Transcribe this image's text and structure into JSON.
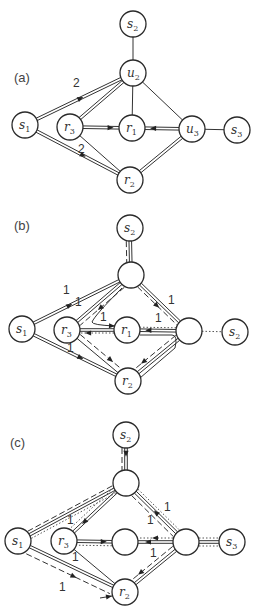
{
  "colors": {
    "stroke": "#2a2a2a",
    "background": "#ffffff",
    "text": "#333333"
  },
  "panels": [
    {
      "id": "a",
      "label": "(a)",
      "label_pos": [
        14,
        82
      ],
      "nodes": [
        {
          "id": "s2",
          "base": "s",
          "sub": "2",
          "x": 133,
          "y": 24
        },
        {
          "id": "u2",
          "base": "u",
          "sub": "2",
          "x": 133,
          "y": 73
        },
        {
          "id": "s1",
          "base": "s",
          "sub": "1",
          "x": 25,
          "y": 125
        },
        {
          "id": "r3",
          "base": "r",
          "sub": "3",
          "x": 70,
          "y": 127
        },
        {
          "id": "r1",
          "base": "r",
          "sub": "1",
          "x": 132,
          "y": 128
        },
        {
          "id": "u3",
          "base": "u",
          "sub": "3",
          "x": 192,
          "y": 129
        },
        {
          "id": "s3",
          "base": "s",
          "sub": "3",
          "x": 237,
          "y": 130
        },
        {
          "id": "r2",
          "base": "r",
          "sub": "2",
          "x": 130,
          "y": 180
        }
      ],
      "edges": [
        {
          "from": "s2",
          "to": "u2",
          "style": "single"
        },
        {
          "from": "u2",
          "to": "r1",
          "style": "single"
        },
        {
          "from": "u2",
          "to": "u3",
          "style": "single"
        },
        {
          "from": "u3",
          "to": "s3",
          "style": "single"
        },
        {
          "from": "r3",
          "to": "r2",
          "style": "single"
        },
        {
          "from": "s1",
          "to": "u2",
          "style": "double",
          "arrow": 0.55
        },
        {
          "from": "r3",
          "to": "u2",
          "style": "double"
        },
        {
          "from": "r3",
          "to": "r1",
          "style": "double",
          "arrow": 0.85
        },
        {
          "from": "u3",
          "to": "r1",
          "style": "double",
          "arrow": 0.85
        },
        {
          "from": "s1",
          "to": "r2",
          "style": "double",
          "arrow": 0.6
        },
        {
          "from": "r2",
          "to": "u3",
          "style": "double"
        }
      ],
      "edge_labels": [
        {
          "text": "2",
          "x": 73,
          "y": 87
        },
        {
          "text": "2",
          "x": 78,
          "y": 153
        }
      ]
    },
    {
      "id": "b",
      "label": "(b)",
      "label_pos": [
        14,
        230
      ],
      "nodes": [
        {
          "id": "s2",
          "base": "s",
          "sub": "2",
          "x": 130,
          "y": 228
        },
        {
          "id": "top",
          "base": "",
          "sub": "",
          "x": 131,
          "y": 275
        },
        {
          "id": "s1",
          "base": "s",
          "sub": "1",
          "x": 22,
          "y": 329
        },
        {
          "id": "r3",
          "base": "r",
          "sub": "3",
          "x": 67,
          "y": 330
        },
        {
          "id": "r1",
          "base": "r",
          "sub": "1",
          "x": 127,
          "y": 330
        },
        {
          "id": "mid",
          "base": "",
          "sub": "",
          "x": 189,
          "y": 331
        },
        {
          "id": "s2r",
          "base": "s",
          "sub": "2",
          "x": 235,
          "y": 332
        },
        {
          "id": "r2",
          "base": "r",
          "sub": "2",
          "x": 128,
          "y": 381
        }
      ],
      "edges": [
        {
          "from": "s2",
          "to": "top",
          "style": "double"
        },
        {
          "from": "s2",
          "to": "top",
          "style": "dash",
          "offset": 4
        },
        {
          "from": "s1",
          "to": "top",
          "style": "double",
          "arrow": 0.45
        },
        {
          "from": "top",
          "to": "r3",
          "style": "double"
        },
        {
          "from": "top",
          "to": "r3",
          "style": "dash",
          "offset": -5,
          "arrow": 0.6
        },
        {
          "from": "top",
          "to": "mid",
          "style": "double"
        },
        {
          "from": "top",
          "to": "mid",
          "style": "dash",
          "offset": 4,
          "arrow": 0.55
        },
        {
          "from": "r3",
          "to": "r1",
          "style": "double"
        },
        {
          "from": "r1",
          "to": "r3",
          "style": "dot",
          "offset": -3,
          "arrow": 0.85
        },
        {
          "from": "mid",
          "to": "r1",
          "style": "double",
          "arrow": 0.85
        },
        {
          "from": "mid",
          "to": "r1",
          "style": "dot",
          "offset": 3
        },
        {
          "from": "mid",
          "to": "s2r",
          "style": "dot"
        },
        {
          "from": "s1",
          "to": "r2",
          "style": "double",
          "arrow": 0.6
        },
        {
          "from": "r3",
          "to": "r2",
          "style": "single"
        },
        {
          "from": "r3",
          "to": "r2",
          "style": "dash",
          "offset": -5,
          "arrow": 0.8
        },
        {
          "from": "mid",
          "to": "r2",
          "style": "double"
        },
        {
          "from": "mid",
          "to": "r2",
          "style": "dash",
          "offset": 5,
          "arrow": 0.85
        }
      ],
      "curves": [
        {
          "d": "M 122 288 Q 95 315 92 322 Q 92 325 115 326",
          "style": "single",
          "arrow_end": true
        },
        {
          "d": "M 140 335 L 172 335 Q 178 335 175 348 L 140 378",
          "style": "single"
        }
      ],
      "edge_labels": [
        {
          "text": "1",
          "x": 63,
          "y": 294
        },
        {
          "text": "1",
          "x": 75,
          "y": 306
        },
        {
          "text": "1",
          "x": 100,
          "y": 321
        },
        {
          "text": "1",
          "x": 155,
          "y": 322
        },
        {
          "text": "1",
          "x": 168,
          "y": 304
        },
        {
          "text": "1",
          "x": 67,
          "y": 352
        }
      ]
    },
    {
      "id": "c",
      "label": "(c)",
      "label_pos": [
        10,
        447
      ],
      "nodes": [
        {
          "id": "s2",
          "base": "s",
          "sub": "2",
          "x": 126,
          "y": 435
        },
        {
          "id": "top",
          "base": "",
          "sub": "",
          "x": 126,
          "y": 483
        },
        {
          "id": "s1",
          "base": "s",
          "sub": "1",
          "x": 18,
          "y": 541
        },
        {
          "id": "r3",
          "base": "r",
          "sub": "3",
          "x": 64,
          "y": 541
        },
        {
          "id": "mid",
          "base": "",
          "sub": "",
          "x": 125,
          "y": 542
        },
        {
          "id": "rt",
          "base": "",
          "sub": "",
          "x": 186,
          "y": 542
        },
        {
          "id": "s3",
          "base": "s",
          "sub": "3",
          "x": 232,
          "y": 542
        },
        {
          "id": "r2",
          "base": "r",
          "sub": "2",
          "x": 125,
          "y": 592
        }
      ],
      "edges": [
        {
          "from": "s2",
          "to": "top",
          "style": "double",
          "arrow": 0.4
        },
        {
          "from": "s2",
          "to": "top",
          "style": "dash",
          "offset": 4
        },
        {
          "from": "s1",
          "to": "top",
          "style": "double"
        },
        {
          "from": "s1",
          "to": "top",
          "style": "dash",
          "offset": -4
        },
        {
          "from": "s1",
          "to": "top",
          "style": "dot",
          "offset": 4
        },
        {
          "from": "top",
          "to": "r3",
          "style": "double",
          "arrow": 0.8
        },
        {
          "from": "top",
          "to": "r3",
          "style": "dot",
          "offset": 5
        },
        {
          "from": "rt",
          "to": "top",
          "style": "double",
          "arrow": 0.55
        },
        {
          "from": "top",
          "to": "rt",
          "style": "dash",
          "offset": 5
        },
        {
          "from": "top",
          "to": "rt",
          "style": "dot",
          "offset": -4
        },
        {
          "from": "r3",
          "to": "mid",
          "style": "double",
          "arrow": 0.85
        },
        {
          "from": "mid",
          "to": "r3",
          "style": "dot",
          "offset": -4
        },
        {
          "from": "rt",
          "to": "mid",
          "style": "double",
          "arrow": 0.8
        },
        {
          "from": "rt",
          "to": "mid",
          "style": "dot",
          "offset": 4,
          "arrow": 0.6
        },
        {
          "from": "rt",
          "to": "s3",
          "style": "double"
        },
        {
          "from": "rt",
          "to": "s3",
          "style": "dot",
          "offset": -4
        },
        {
          "from": "rt",
          "to": "s3",
          "style": "dot",
          "offset": 4
        },
        {
          "from": "s1",
          "to": "r2",
          "style": "double"
        },
        {
          "from": "s1",
          "to": "r2",
          "style": "dash",
          "offset": 8,
          "arrow": 0.6
        },
        {
          "from": "r3",
          "to": "r2",
          "style": "single"
        },
        {
          "from": "rt",
          "to": "r2",
          "style": "double"
        },
        {
          "from": "rt",
          "to": "r2",
          "style": "dash",
          "offset": 5,
          "arrow": 0.85
        }
      ],
      "curves": [
        {
          "d": "M 100 598 L 112 596",
          "style": "single",
          "arrow_end": true
        }
      ],
      "edge_labels": [
        {
          "text": "1",
          "x": 67,
          "y": 524
        },
        {
          "text": "1",
          "x": 164,
          "y": 511
        },
        {
          "text": "1",
          "x": 147,
          "y": 524
        },
        {
          "text": "1",
          "x": 150,
          "y": 557
        },
        {
          "text": "1",
          "x": 72,
          "y": 561
        },
        {
          "text": "1",
          "x": 59,
          "y": 591
        }
      ]
    }
  ]
}
